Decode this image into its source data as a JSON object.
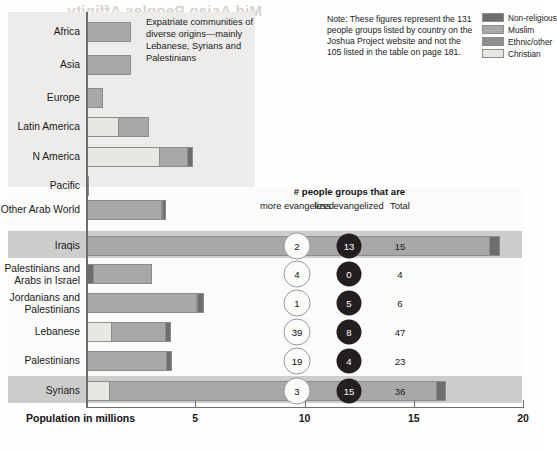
{
  "ghost_title": "Mid Asian Peoples Affinity",
  "note": {
    "text": "Note: These figures represent the 131 people groups listed by country on the Joshua Project website and not the 105 listed in the table on page 181."
  },
  "legend": {
    "items": [
      {
        "label": "Non-religious",
        "color": "#6d6d6d"
      },
      {
        "label": "Muslim",
        "color": "#a8a8a8"
      },
      {
        "label": "Ethnic/other",
        "color": "#8e8e8e"
      },
      {
        "label": "Christian",
        "color": "#e8e7e2"
      }
    ]
  },
  "annotation": {
    "expatriate": "Expatriate communities of diverse origins—mainly Lebanese, Syrians and Palestinians"
  },
  "table_header": {
    "title": "# people groups that are",
    "more": "more\nevangelized",
    "less": "less\nevangelized",
    "total": "Total"
  },
  "axis": {
    "title": "Population in millions",
    "ticks": [
      "5",
      "10",
      "15",
      "20"
    ],
    "min": 0,
    "max": 20
  },
  "chart_data": {
    "type": "bar",
    "title": "Mid Asian Peoples Affinity",
    "xlabel": "Population in millions",
    "ylabel": "",
    "xlim": [
      0,
      20
    ],
    "stacked": true,
    "grid": false,
    "legend_position": "top-right",
    "series": [
      {
        "name": "Christian",
        "color": "#e8e7e2"
      },
      {
        "name": "Muslim",
        "color": "#a8a8a8"
      },
      {
        "name": "Ethnic/other",
        "color": "#8e8e8e"
      },
      {
        "name": "Non-religious",
        "color": "#6d6d6d"
      }
    ],
    "upper_section": {
      "note": "Diaspora / expatriate regions",
      "categories": [
        "Africa",
        "Asia",
        "Europe",
        "Latin America",
        "N America",
        "Pacific",
        "Other Arab World"
      ],
      "rows": [
        {
          "category": "Africa",
          "segments": [
            {
              "series": "Christian",
              "value": 0.1
            },
            {
              "series": "Muslim",
              "value": 2.0
            }
          ]
        },
        {
          "category": "Asia",
          "segments": [
            {
              "series": "Christian",
              "value": 0.1
            },
            {
              "series": "Muslim",
              "value": 2.0
            }
          ]
        },
        {
          "category": "Europe",
          "segments": [
            {
              "series": "Christian",
              "value": 0.1
            },
            {
              "series": "Muslim",
              "value": 0.7
            }
          ]
        },
        {
          "category": "Latin America",
          "segments": [
            {
              "series": "Christian",
              "value": 1.5
            },
            {
              "series": "Muslim",
              "value": 1.4
            }
          ]
        },
        {
          "category": "N America",
          "segments": [
            {
              "series": "Christian",
              "value": 3.4
            },
            {
              "series": "Muslim",
              "value": 1.3
            },
            {
              "series": "Non-religious",
              "value": 0.25
            }
          ]
        },
        {
          "category": "Pacific",
          "segments": [
            {
              "series": "Non-religious",
              "value": 0.12
            }
          ]
        },
        {
          "category": "Other Arab World",
          "segments": [
            {
              "series": "Muslim",
              "value": 3.5
            },
            {
              "series": "Non-religious",
              "value": 0.2
            }
          ]
        }
      ]
    },
    "lower_section": {
      "categories": [
        "Iraqis",
        "Palestinians and Arabs in Israel",
        "Jordanians and Palestinians",
        "Lebanese",
        "Palestinians",
        "Syrians"
      ],
      "rows": [
        {
          "category": "Iraqis",
          "label": "Iraqis",
          "segments": [
            {
              "series": "Muslim",
              "value": 18.5
            },
            {
              "series": "Non-religious",
              "value": 0.5
            }
          ],
          "total_population": 19.0,
          "more_evangelized": "2",
          "less_evangelized": "13",
          "total": "15"
        },
        {
          "category": "Palestinians and Arabs in Israel",
          "label": "Palestinians and\nArabs in Israel",
          "segments": [
            {
              "series": "Non-religious",
              "value": 0.35
            },
            {
              "series": "Muslim",
              "value": 2.7
            }
          ],
          "total_population": 3.05,
          "more_evangelized": "4",
          "less_evangelized": "0",
          "total": "4"
        },
        {
          "category": "Jordanians and Palestinians",
          "label": "Jordanians and\nPalestinians",
          "segments": [
            {
              "series": "Muslim",
              "value": 5.1
            },
            {
              "series": "Non-religious",
              "value": 0.35
            }
          ],
          "total_population": 5.45,
          "more_evangelized": "1",
          "less_evangelized": "5",
          "total": "6"
        },
        {
          "category": "Lebanese",
          "label": "Lebanese",
          "segments": [
            {
              "series": "Christian",
              "value": 1.2
            },
            {
              "series": "Muslim",
              "value": 2.5
            },
            {
              "series": "Non-religious",
              "value": 0.25
            }
          ],
          "total_population": 3.95,
          "more_evangelized": "39",
          "less_evangelized": "8",
          "total": "47"
        },
        {
          "category": "Palestinians",
          "label": "Palestinians",
          "segments": [
            {
              "series": "Muslim",
              "value": 3.7
            },
            {
              "series": "Non-religious",
              "value": 0.25
            }
          ],
          "total_population": 3.95,
          "more_evangelized": "19",
          "less_evangelized": "4",
          "total": "23"
        },
        {
          "category": "Syrians",
          "label": "Syrians",
          "segments": [
            {
              "series": "Christian",
              "value": 1.1
            },
            {
              "series": "Muslim",
              "value": 15.0
            },
            {
              "series": "Non-religious",
              "value": 0.45
            }
          ],
          "total_population": 16.55,
          "more_evangelized": "3",
          "less_evangelized": "15",
          "total": "36"
        }
      ]
    }
  }
}
